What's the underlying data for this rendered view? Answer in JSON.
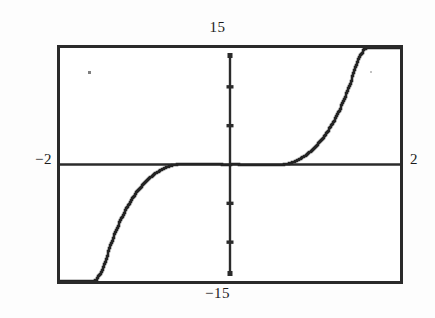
{
  "window": {
    "ymax_label": "15",
    "ymin_label": "−15",
    "xmin_label": "−2",
    "xmax_label": "2"
  },
  "chart_data": {
    "type": "line",
    "title": "",
    "xlabel": "",
    "ylabel": "",
    "xlim": [
      -2,
      2
    ],
    "ylim": [
      -15,
      15
    ],
    "grid": false,
    "legend": null,
    "axes": {
      "x_axis_drawn": true,
      "y_axis_drawn": true,
      "x_axis_y_value": 0,
      "y_axis_x_value": 0,
      "y_tick_values": [
        -10,
        -5,
        5,
        10
      ],
      "x_tick_values": []
    },
    "series": [
      {
        "name": "y",
        "color": "#222222",
        "x": [
          -2.0,
          -1.9,
          -1.8,
          -1.7,
          -1.6,
          -1.5,
          -1.4,
          -1.3,
          -1.2,
          -1.1,
          -1.0,
          -0.9,
          -0.8,
          -0.7,
          -0.6,
          -0.5,
          -0.4,
          -0.3,
          -0.2,
          -0.1,
          0.0,
          0.1,
          0.2,
          0.3,
          0.4,
          0.5,
          0.6,
          0.7,
          0.8,
          0.9,
          1.0,
          1.1,
          1.2,
          1.3,
          1.4,
          1.5,
          1.6,
          1.7,
          1.8,
          1.9,
          2.0
        ],
        "y": [
          -15.0,
          -15.0,
          -15.0,
          -15.0,
          -15.0,
          -13.4,
          -10.1,
          -7.4,
          -5.25,
          -3.55,
          -2.25,
          -1.3,
          -0.62,
          -0.18,
          0.05,
          0.12,
          0.1,
          0.05,
          0.02,
          0.0,
          0.0,
          0.0,
          -0.02,
          -0.05,
          -0.1,
          -0.12,
          -0.05,
          0.18,
          0.62,
          1.3,
          2.25,
          3.55,
          5.25,
          7.4,
          10.1,
          13.4,
          15.0,
          15.0,
          15.0,
          15.0,
          15.0
        ],
        "features": [
          {
            "kind": "local-maximum",
            "x": -0.55,
            "y": 0.13
          },
          {
            "kind": "local-minimum",
            "x": 0.55,
            "y": -0.13
          },
          {
            "kind": "inflection",
            "x": 0.0,
            "y": 0.0
          }
        ]
      }
    ]
  },
  "artifacts": {
    "scan_speck_label": "scan-speck"
  }
}
